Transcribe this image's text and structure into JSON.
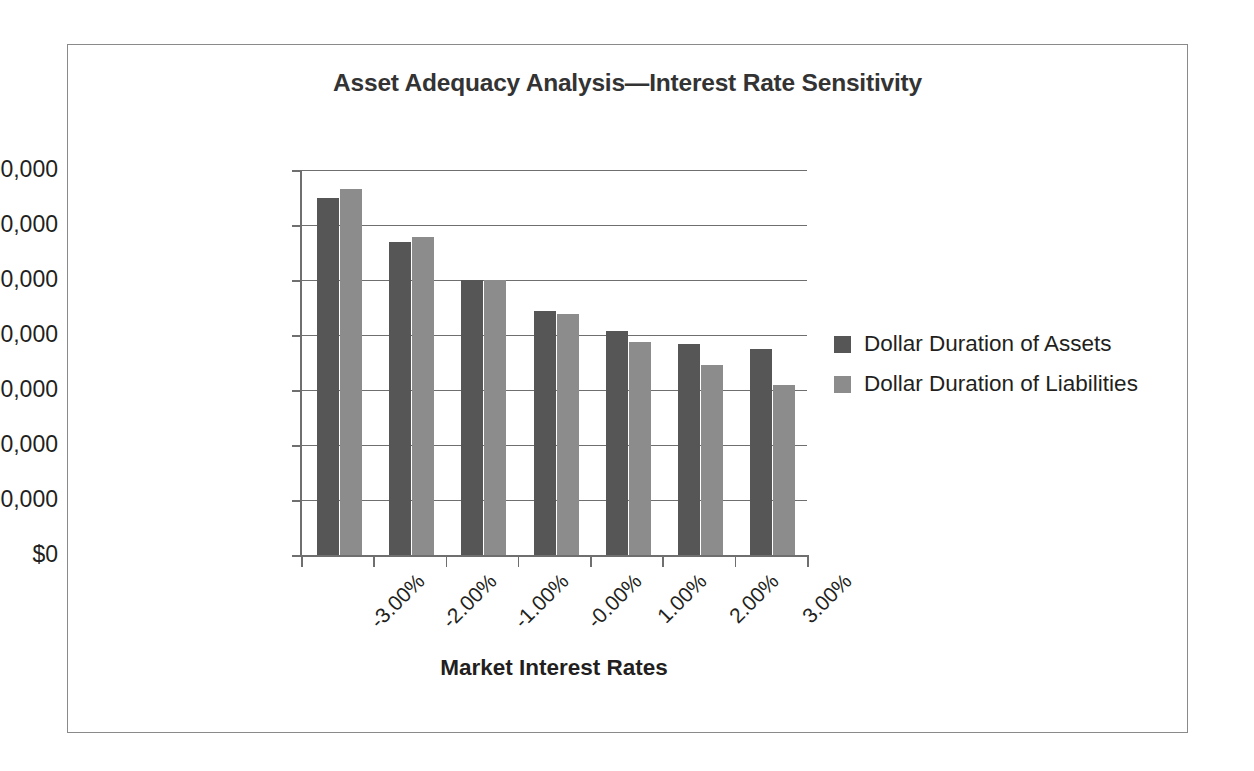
{
  "chart_data": {
    "type": "bar",
    "title": "Asset Adequacy Analysis—Interest Rate Sensitivity",
    "xlabel": "Market Interest Rates",
    "ylabel": "",
    "categories": [
      "-3.00%",
      "-2.00%",
      "-1.00%",
      "-0.00%",
      "1.00%",
      "2.00%",
      "3.00%"
    ],
    "series": [
      {
        "name": "Dollar Duration of Assets",
        "color": "#565656",
        "values": [
          64900000000,
          56900000000,
          50000000000,
          44400000000,
          40700000000,
          38300000000,
          37400000000
        ]
      },
      {
        "name": "Dollar Duration of Liabilities",
        "color": "#8c8c8c",
        "values": [
          66500000000,
          57800000000,
          50000000000,
          43800000000,
          38800000000,
          34600000000,
          31000000000
        ]
      }
    ],
    "ylim": [
      0,
      70000000000
    ],
    "ytick_values": [
      0,
      10000000000,
      20000000000,
      30000000000,
      40000000000,
      50000000000,
      60000000000,
      70000000000
    ],
    "ytick_labels": [
      "$0",
      "$10,000,000,000",
      "$20,000,000,000",
      "$30,000,000,000",
      "$40,000,000,000",
      "$50,000,000,000",
      "$60,000,000,000",
      "$70,000,000,000"
    ],
    "grid": true,
    "legend_position": "right",
    "legend": [
      "Dollar Duration of Assets",
      "Dollar Duration of Liabilities"
    ]
  },
  "frame": {
    "border_color": "#8a8a8a"
  }
}
